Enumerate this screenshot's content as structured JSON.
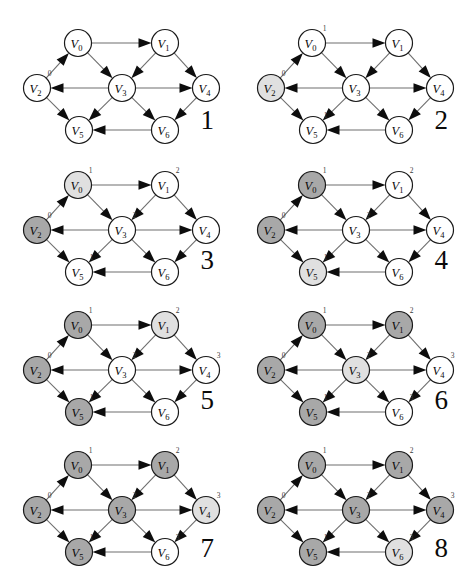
{
  "figure": {
    "panel_count": 8,
    "node_ids": [
      "V0",
      "V1",
      "V2",
      "V3",
      "V4",
      "V5",
      "V6"
    ],
    "node_labels": {
      "V0": "V",
      "V1": "V",
      "V2": "V",
      "V3": "V",
      "V4": "V",
      "V5": "V",
      "V6": "V"
    },
    "node_subscripts": {
      "V0": "0",
      "V1": "1",
      "V2": "2",
      "V3": "3",
      "V4": "4",
      "V5": "5",
      "V6": "6"
    },
    "colors": {
      "white": "#ffffff",
      "light_gray": "#e0e0e0",
      "dark_gray": "#a8a8a8",
      "stroke": "#1a1a1a",
      "edge": "#6e6e6e",
      "text": "#0a0a0a"
    }
  },
  "graph": {
    "nodes": [
      {
        "id": "V0",
        "x": 78,
        "y": 43
      },
      {
        "id": "V1",
        "x": 165,
        "y": 43
      },
      {
        "id": "V2",
        "x": 37,
        "y": 88
      },
      {
        "id": "V3",
        "x": 122,
        "y": 88
      },
      {
        "id": "V4",
        "x": 206,
        "y": 88
      },
      {
        "id": "V5",
        "x": 79,
        "y": 130
      },
      {
        "id": "V6",
        "x": 165,
        "y": 130
      }
    ],
    "edges": [
      {
        "from": "V0",
        "to": "V1"
      },
      {
        "from": "V0",
        "to": "V3"
      },
      {
        "from": "V2",
        "to": "V0"
      },
      {
        "from": "V2",
        "to": "V5"
      },
      {
        "from": "V3",
        "to": "V2"
      },
      {
        "from": "V3",
        "to": "V4"
      },
      {
        "from": "V3",
        "to": "V5"
      },
      {
        "from": "V3",
        "to": "V6"
      },
      {
        "from": "V1",
        "to": "V3"
      },
      {
        "from": "V1",
        "to": "V4"
      },
      {
        "from": "V4",
        "to": "V6"
      },
      {
        "from": "V6",
        "to": "V5"
      }
    ]
  },
  "panels": [
    {
      "number": "1",
      "fills": {
        "V0": "white",
        "V1": "white",
        "V2": "white",
        "V3": "white",
        "V4": "white",
        "V5": "white",
        "V6": "white"
      },
      "superscripts": {
        "V2": "0"
      }
    },
    {
      "number": "2",
      "fills": {
        "V0": "white",
        "V1": "white",
        "V2": "light_gray",
        "V3": "white",
        "V4": "white",
        "V5": "white",
        "V6": "white"
      },
      "superscripts": {
        "V2": "0",
        "V0": "1",
        "V5": "1"
      }
    },
    {
      "number": "3",
      "fills": {
        "V0": "light_gray",
        "V1": "white",
        "V2": "dark_gray",
        "V3": "white",
        "V4": "white",
        "V5": "white",
        "V6": "white"
      },
      "superscripts": {
        "V2": "0",
        "V0": "1",
        "V5": "1",
        "V1": "2",
        "V3": "2"
      }
    },
    {
      "number": "4",
      "fills": {
        "V0": "dark_gray",
        "V1": "white",
        "V2": "dark_gray",
        "V3": "white",
        "V4": "white",
        "V5": "light_gray",
        "V6": "white"
      },
      "superscripts": {
        "V2": "0",
        "V0": "1",
        "V5": "1",
        "V1": "2",
        "V3": "2"
      }
    },
    {
      "number": "5",
      "fills": {
        "V0": "dark_gray",
        "V1": "light_gray",
        "V2": "dark_gray",
        "V3": "white",
        "V4": "white",
        "V5": "dark_gray",
        "V6": "white"
      },
      "superscripts": {
        "V2": "0",
        "V0": "1",
        "V5": "1",
        "V1": "2",
        "V3": "2",
        "V4": "3"
      }
    },
    {
      "number": "6",
      "fills": {
        "V0": "dark_gray",
        "V1": "dark_gray",
        "V2": "dark_gray",
        "V3": "light_gray",
        "V4": "white",
        "V5": "dark_gray",
        "V6": "white"
      },
      "superscripts": {
        "V2": "0",
        "V0": "1",
        "V5": "1",
        "V1": "2",
        "V3": "2",
        "V4": "3",
        "V6": "3"
      }
    },
    {
      "number": "7",
      "fills": {
        "V0": "dark_gray",
        "V1": "dark_gray",
        "V2": "dark_gray",
        "V3": "dark_gray",
        "V4": "light_gray",
        "V5": "dark_gray",
        "V6": "white"
      },
      "superscripts": {
        "V2": "0",
        "V0": "1",
        "V5": "1",
        "V1": "2",
        "V3": "2",
        "V4": "3",
        "V6": "3"
      }
    },
    {
      "number": "8",
      "fills": {
        "V0": "dark_gray",
        "V1": "dark_gray",
        "V2": "dark_gray",
        "V3": "dark_gray",
        "V4": "dark_gray",
        "V5": "dark_gray",
        "V6": "light_gray"
      },
      "superscripts": {
        "V2": "0",
        "V0": "1",
        "V5": "1",
        "V1": "2",
        "V3": "2",
        "V4": "3",
        "V6": "3"
      }
    }
  ]
}
